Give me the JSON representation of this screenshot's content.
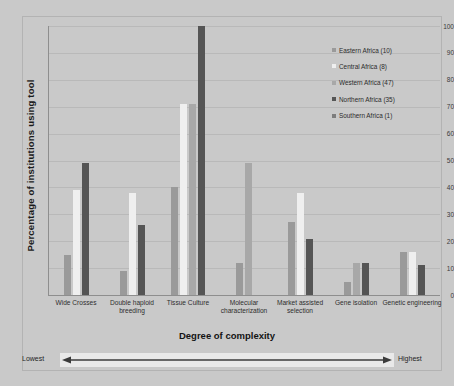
{
  "chart_data": {
    "type": "bar",
    "title": "",
    "xlabel": "Degree of complexity",
    "ylabel": "Percentage of institutions using tool",
    "ylim": [
      0,
      100
    ],
    "ytick_labels": [
      "0",
      "10",
      "20",
      "30",
      "40",
      "50",
      "60",
      "70",
      "80",
      "90",
      "100"
    ],
    "ytick_values": [
      0,
      10,
      20,
      30,
      40,
      50,
      60,
      70,
      80,
      90,
      100
    ],
    "grid": true,
    "legend_position": "right-inside",
    "categories": [
      "Wide Crosses",
      "Double haploid breeding",
      "Tissue Culture",
      "Molecular characterization",
      "Market assisted selection",
      "Gene isolation",
      "Genetic engineering"
    ],
    "series": [
      {
        "name": "Eastern Africa (10)",
        "color": "#9a9a9a",
        "values": [
          15,
          9,
          40,
          12,
          27,
          5,
          16
        ]
      },
      {
        "name": "Central Africa (8)",
        "color": "#efefef",
        "values": [
          39,
          38,
          71,
          0,
          38,
          0,
          16
        ]
      },
      {
        "name": "Western Africa (47)",
        "color": "#a8a8a8",
        "values": [
          0,
          0,
          71,
          49,
          0,
          12,
          0
        ]
      },
      {
        "name": "Northern Africa (35)",
        "color": "#555555",
        "values": [
          49,
          26,
          100,
          0,
          21,
          12,
          11
        ]
      },
      {
        "name": "Southern Africa (1)",
        "color": "#7d7d7d",
        "values": [
          0,
          0,
          0,
          0,
          0,
          0,
          0
        ]
      }
    ]
  },
  "axis_annotations": {
    "lowest_label": "Lowest",
    "highest_label": "Highest"
  }
}
